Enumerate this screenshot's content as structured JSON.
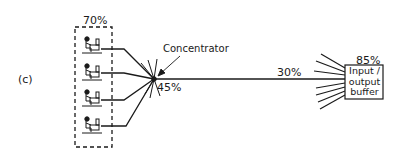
{
  "figure": {
    "part_label": "(c)",
    "terminal_group": {
      "utilization": "70%",
      "terminal_count": 4,
      "terminal_icon": "person-at-terminal-icon"
    },
    "concentrator": {
      "label": "Concentrator",
      "utilization": "45%"
    },
    "trunk_line": {
      "utilization": "30%"
    },
    "io_buffer": {
      "utilization": "85%",
      "label_lines": [
        "Input /",
        "output",
        "buffer"
      ]
    },
    "colors": {
      "line": "#1a1a1a",
      "background": "#ffffff"
    }
  }
}
